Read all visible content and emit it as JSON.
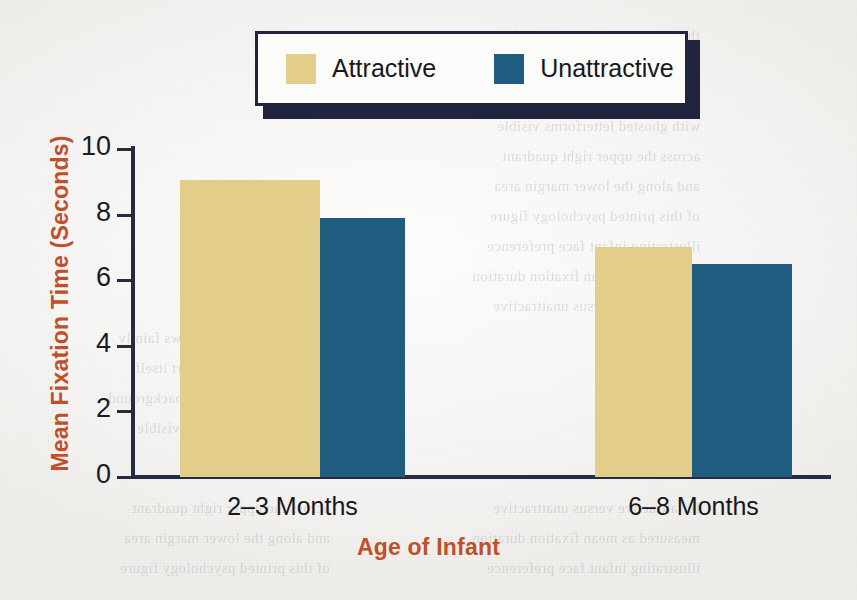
{
  "chart_data": {
    "type": "bar",
    "title": "",
    "subtitle": "",
    "categories": [
      "2–3 Months",
      "6–8 Months"
    ],
    "series": [
      {
        "name": "Attractive",
        "color": "#e3cd8a",
        "values": [
          9.05,
          7.0
        ]
      },
      {
        "name": "Unattractive",
        "color": "#1f5c80",
        "values": [
          7.9,
          6.5
        ]
      }
    ],
    "xlabel": "Age of Infant",
    "ylabel": "Mean Fixation Time (Seconds)",
    "ylim": [
      0,
      10
    ],
    "ytick_step": 2,
    "yticks": [
      "10",
      "8",
      "6",
      "4",
      "2",
      "0"
    ],
    "grid": false,
    "legend_position": "top-center"
  },
  "axes": {
    "y_title": "Mean Fixation Time (Seconds)",
    "x_title": "Age of Infant",
    "axis_color": "#252a45",
    "title_color": "#c0502a"
  },
  "legend": {
    "entries": [
      {
        "label": "Attractive",
        "color": "#e3cd8a"
      },
      {
        "label": "Unattractive",
        "color": "#1f5c80"
      }
    ],
    "border_color": "#20243f",
    "background": "#fbfbfa"
  },
  "page": {
    "background": "#f7f6f4",
    "bleed_through": [
      "the reverse page text shows faintly",
      "and is not part of the chart itself",
      "scanned textbook figure background",
      "with ghosted letterforms visible",
      "across the upper right quadrant",
      "and along the lower margin area",
      "of this printed psychology figure",
      "illustrating infant face preference",
      "measured as mean fixation duration",
      "for attractive versus unattractive"
    ]
  }
}
